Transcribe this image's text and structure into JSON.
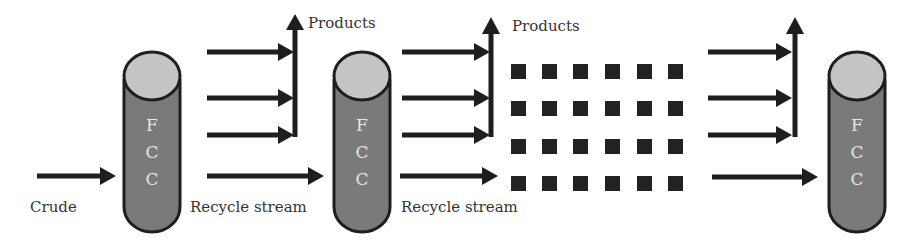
{
  "diagram": {
    "type": "process-flow",
    "colors": {
      "column_body": "#7a7a7a",
      "column_top": "#c4c4c4",
      "outline": "#1e1e1e",
      "arrow": "#1e1e1e",
      "column_text": "#e6e6e6",
      "label_text": "#333333",
      "square": "#222222"
    },
    "units": [
      {
        "id": "fcc-1",
        "letters": [
          "F",
          "C",
          "C"
        ]
      },
      {
        "id": "fcc-2",
        "letters": [
          "F",
          "C",
          "C"
        ]
      },
      {
        "id": "fcc-3",
        "letters": [
          "F",
          "C",
          "C"
        ]
      }
    ],
    "labels": {
      "crude": "Crude",
      "recycle_1": "Recycle stream",
      "recycle_2": "Recycle stream",
      "products_1": "Products",
      "products_2": "Products"
    },
    "ellipsis_grid": {
      "rows": 4,
      "cols": 6
    }
  }
}
